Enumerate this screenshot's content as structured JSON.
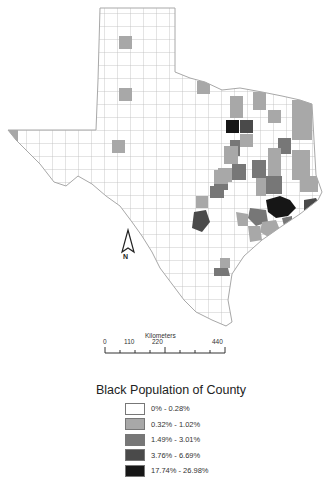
{
  "map": {
    "title": "Black Population of County",
    "region": "Texas counties",
    "north_arrow_label": "N",
    "scale": {
      "unit_label": "Kilometers",
      "ticks": [
        "0",
        "110",
        "220",
        "440"
      ]
    },
    "legend": {
      "title": "Black Population of County",
      "classes": [
        {
          "label": "0% - 0.28%",
          "color": "#ffffff"
        },
        {
          "label": "0.32% - 1.02%",
          "color": "#a8a8a8"
        },
        {
          "label": "1.49% - 3.01%",
          "color": "#777777"
        },
        {
          "label": "3.76% - 6.69%",
          "color": "#4a4a4a"
        },
        {
          "label": "17.74% - 26.98%",
          "color": "#161616"
        }
      ]
    },
    "colors": {
      "county_border": "#b8b8b8",
      "background": "#ffffff"
    }
  }
}
